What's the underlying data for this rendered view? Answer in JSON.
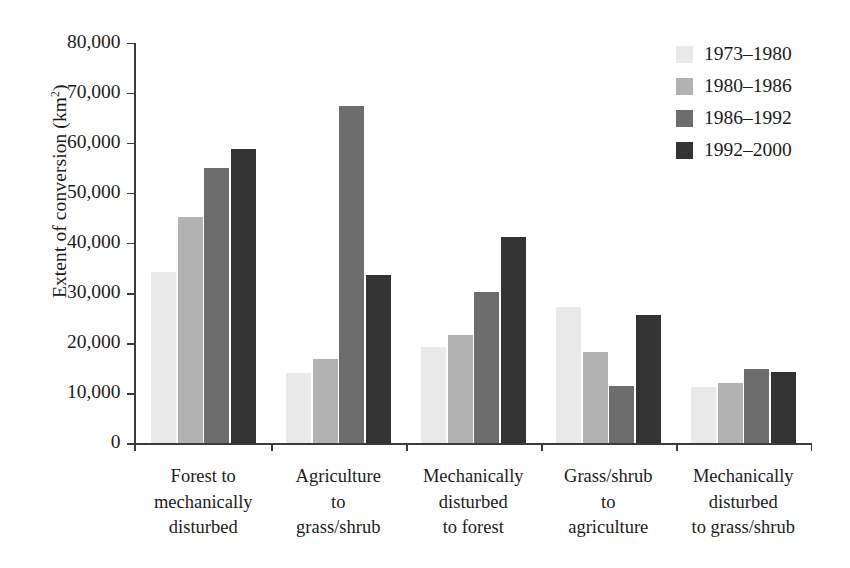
{
  "chart_data": {
    "type": "bar",
    "title": "",
    "xlabel": "",
    "ylabel": "Extent of conversion (km2)",
    "ylabel_base": "Extent of conversion (km",
    "ylabel_sup": "2",
    "ylabel_close": ")",
    "ylim": [
      0,
      80000
    ],
    "grid": false,
    "legend_position": "top-right",
    "ytick_labels": [
      "80,000",
      "70,000",
      "60,000",
      "50,000",
      "40,000",
      "30,000",
      "20,000",
      "10,000",
      "0"
    ],
    "ytick_values": [
      80000,
      70000,
      60000,
      50000,
      40000,
      30000,
      20000,
      10000,
      0
    ],
    "categories": [
      "Forest to mechanically disturbed",
      "Agriculture to grass/shrub",
      "Mechanically disturbed to forest",
      "Grass/shrub to agriculture",
      "Mechanically disturbed to grass/shrub"
    ],
    "category_lines": [
      [
        "Forest to",
        "mechanically",
        "disturbed"
      ],
      [
        "Agriculture",
        "to",
        "grass/shrub"
      ],
      [
        "Mechanically",
        "disturbed",
        "to forest"
      ],
      [
        "Grass/shrub",
        "to",
        "agriculture"
      ],
      [
        "Mechanically",
        "disturbed",
        "to grass/shrub"
      ]
    ],
    "series": [
      {
        "name": "1973-1980",
        "label": "1973–1980",
        "color": "#e9e9e9",
        "values": [
          34200,
          14000,
          19300,
          27300,
          11300
        ]
      },
      {
        "name": "1980-1986",
        "label": "1980–1986",
        "color": "#b2b2b2",
        "values": [
          45200,
          16800,
          21600,
          18300,
          12000
        ]
      },
      {
        "name": "1986-1992",
        "label": "1986–1992",
        "color": "#6d6d6d",
        "values": [
          54900,
          67300,
          30200,
          11500,
          14800
        ]
      },
      {
        "name": "1992-2000",
        "label": "1992–2000",
        "color": "#333333",
        "values": [
          58700,
          33600,
          41200,
          25700,
          14300
        ]
      }
    ]
  },
  "legend": {
    "items": [
      {
        "label": "1973–1980",
        "color": "#e9e9e9"
      },
      {
        "label": "1980–1986",
        "color": "#b2b2b2"
      },
      {
        "label": "1986–1992",
        "color": "#6d6d6d"
      },
      {
        "label": "1992–2000",
        "color": "#333333"
      }
    ]
  }
}
